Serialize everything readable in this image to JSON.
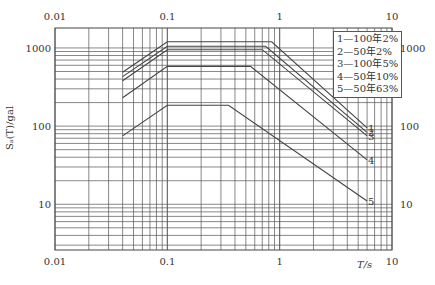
{
  "chart_data": {
    "type": "line",
    "title": "",
    "xlabel": "T/s",
    "ylabel": "Sa(T)/gal",
    "xscale": "log",
    "yscale": "log",
    "xlim": [
      0.01,
      10
    ],
    "ylim": [
      2.6,
      1800
    ],
    "x_ticks": [
      "0.01",
      "0.1",
      "1",
      "10"
    ],
    "y_ticks": [
      "10",
      "100",
      "1000"
    ],
    "grid": true,
    "legend_position": "upper right",
    "series": [
      {
        "name": "1—100年2%",
        "label": "1",
        "points": [
          [
            0.04,
            490
          ],
          [
            0.1,
            1200
          ],
          [
            0.85,
            1200
          ],
          [
            6,
            95
          ]
        ]
      },
      {
        "name": "2—50年2%",
        "label": "2",
        "points": [
          [
            0.04,
            430
          ],
          [
            0.1,
            1050
          ],
          [
            0.75,
            1050
          ],
          [
            6,
            83
          ]
        ]
      },
      {
        "name": "3—100年5%",
        "label": "3",
        "points": [
          [
            0.04,
            380
          ],
          [
            0.1,
            950
          ],
          [
            0.7,
            950
          ],
          [
            6,
            75
          ]
        ]
      },
      {
        "name": "4—50年10%",
        "label": "4",
        "points": [
          [
            0.04,
            230
          ],
          [
            0.1,
            580
          ],
          [
            0.55,
            580
          ],
          [
            6,
            37
          ]
        ]
      },
      {
        "name": "5—50年63%",
        "label": "5",
        "points": [
          [
            0.04,
            75
          ],
          [
            0.1,
            185
          ],
          [
            0.35,
            185
          ],
          [
            6,
            11
          ]
        ]
      }
    ]
  },
  "axes": {
    "x_top_ticks": [
      "0.01",
      "0.1",
      "1",
      "10"
    ],
    "x_bottom_ticks": [
      "0.01",
      "0.1",
      "1",
      "10"
    ],
    "y_left_ticks": [
      "1000",
      "100",
      "10"
    ],
    "y_right_ticks": [
      "1000",
      "100",
      "10"
    ],
    "xlabel": "T/s",
    "ylabel": "Sₐ(T)/gal"
  },
  "legend": {
    "items": [
      "1—100年2%",
      "2—50年2%",
      "3—100年5%",
      "4—50年10%",
      "5—50年63%"
    ]
  },
  "curve_labels": [
    "1",
    "2",
    "3",
    "4",
    "5"
  ],
  "colors": {
    "line": "#444444",
    "grid": "#555555",
    "text": "#333333"
  }
}
